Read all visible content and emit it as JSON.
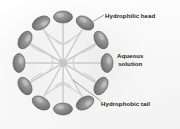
{
  "figure": {
    "type": "micelle-cross-section-diagram",
    "background_color": "#fdfdfd"
  },
  "labels": {
    "hydrophilic_head": "Hydrophilic head",
    "aqueous_solution_line1": "Aqueous",
    "aqueous_solution_line2": "solution",
    "hydrophobic_tail": "Hydrophobic tail"
  },
  "colors": {
    "head_fill": "#8c8c8c",
    "head_edge": "#5e5e5e",
    "head_highlight": "#bdbdbd",
    "tail_web": "#c9c9c9",
    "leader_line": "#7a7a7a",
    "text": "#242424"
  },
  "diagram": {
    "ring_center_x": 63,
    "ring_center_y": 63,
    "ring_radius_x": 44,
    "ring_radius_y": 46,
    "head_count": 12,
    "head_rx": 9.5,
    "head_ry": 6.0,
    "heads": [
      {
        "index": 1,
        "angle_deg": -90,
        "cx": 63,
        "cy": 17,
        "rotation_deg": 0
      },
      {
        "index": 2,
        "angle_deg": -60,
        "cx": 85,
        "cy": 23,
        "rotation_deg": 30
      },
      {
        "index": 3,
        "angle_deg": -30,
        "cx": 101,
        "cy": 40,
        "rotation_deg": 60
      },
      {
        "index": 4,
        "angle_deg": 0,
        "cx": 107,
        "cy": 63,
        "rotation_deg": 90
      },
      {
        "index": 5,
        "angle_deg": 30,
        "cx": 101,
        "cy": 86,
        "rotation_deg": 120
      },
      {
        "index": 6,
        "angle_deg": 60,
        "cx": 85,
        "cy": 103,
        "rotation_deg": 150
      },
      {
        "index": 7,
        "angle_deg": 90,
        "cx": 63,
        "cy": 109,
        "rotation_deg": 0
      },
      {
        "index": 8,
        "angle_deg": 120,
        "cx": 41,
        "cy": 103,
        "rotation_deg": 30
      },
      {
        "index": 9,
        "angle_deg": 150,
        "cx": 25,
        "cy": 86,
        "rotation_deg": 60
      },
      {
        "index": 10,
        "angle_deg": 180,
        "cx": 19,
        "cy": 63,
        "rotation_deg": 90
      },
      {
        "index": 11,
        "angle_deg": 210,
        "cx": 25,
        "cy": 40,
        "rotation_deg": 120
      },
      {
        "index": 12,
        "angle_deg": 240,
        "cx": 41,
        "cy": 23,
        "rotation_deg": 150
      }
    ],
    "leader_lines": [
      {
        "name": "head-leader",
        "x1": 92,
        "y1": 22,
        "x2": 104,
        "y2": 15
      },
      {
        "name": "tail-leader",
        "x1": 73,
        "y1": 80,
        "x2": 101,
        "y2": 101
      }
    ]
  }
}
